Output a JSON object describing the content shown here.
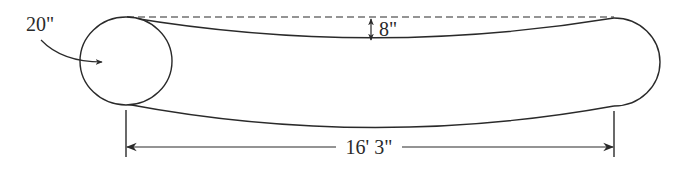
{
  "diagram": {
    "type": "technical-dimension-drawing",
    "labels": {
      "diameter": "20\"",
      "bow_offset": "8\"",
      "length": "16' 3\""
    },
    "colors": {
      "line": "#2a2a2a",
      "background": "#ffffff"
    }
  }
}
